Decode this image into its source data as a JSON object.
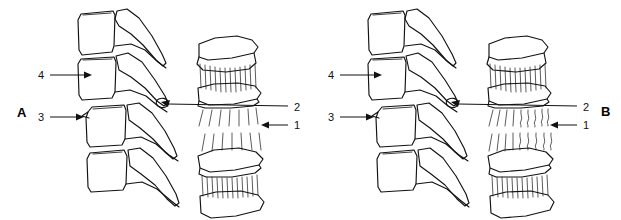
{
  "figure": {
    "type": "line-drawing",
    "background_color": "#ffffff",
    "ink_color": "#121212",
    "width": 621,
    "height": 220
  },
  "panels": [
    {
      "id": "A",
      "letter": "A",
      "letter_x": 17,
      "letter_y": 117,
      "description": "Intact annulus fibrosus: straight parallel collagen fibers",
      "callouts": [
        {
          "number": "1",
          "label_x": 292,
          "label_y": 129,
          "line_from_x": 288,
          "line_to_x": 262,
          "line_y": 125,
          "arrow": "left"
        },
        {
          "number": "2",
          "label_x": 292,
          "label_y": 111,
          "line_from_x": 288,
          "line_to_x": 163,
          "line_y": 106,
          "arrow": "left"
        },
        {
          "number": "3",
          "label_x": 41,
          "label_y": 121,
          "line_from_x": 50,
          "line_to_x": 82,
          "line_y": 117,
          "arrow": "right"
        },
        {
          "number": "4",
          "label_x": 41,
          "label_y": 79,
          "line_from_x": 50,
          "line_to_x": 88,
          "line_y": 75,
          "arrow": "right"
        }
      ]
    },
    {
      "id": "B",
      "letter": "B",
      "letter_x": 601,
      "letter_y": 116,
      "description": "Disrupted annulus fibrosus: buckled and wavy collagen fibers",
      "callouts": [
        {
          "number": "1",
          "label_x": 581,
          "label_y": 129,
          "line_from_x": 577,
          "line_to_x": 551,
          "line_y": 125,
          "arrow": "left"
        },
        {
          "number": "2",
          "label_x": 581,
          "label_y": 111,
          "line_from_x": 577,
          "line_to_x": 440,
          "line_y": 106,
          "arrow": "left"
        },
        {
          "number": "3",
          "label_x": 331,
          "label_y": 121,
          "line_from_x": 340,
          "line_to_x": 371,
          "line_y": 117,
          "arrow": "right"
        },
        {
          "number": "4",
          "label_x": 331,
          "label_y": 79,
          "line_from_x": 340,
          "line_to_x": 377,
          "line_y": 75,
          "arrow": "right"
        }
      ]
    }
  ],
  "legend_numbers": [
    "1",
    "2",
    "3",
    "4"
  ]
}
